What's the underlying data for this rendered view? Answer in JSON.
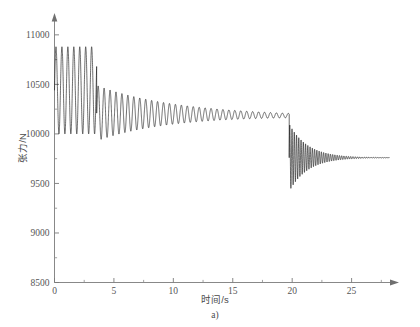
{
  "figure": {
    "caption": "a)",
    "background_color": "#ffffff",
    "trace_color": "#141414",
    "axis_color": "#7a7a7a"
  },
  "axes": {
    "y": {
      "title": "张力/N",
      "tick_labels": [
        "8500",
        "9000",
        "9500",
        "10000",
        "10500",
        "11000"
      ],
      "tick_values": [
        8500,
        9000,
        9500,
        10000,
        10500,
        11000
      ],
      "minor_tick_values": [
        8750,
        9250,
        9750,
        10250,
        10750
      ]
    },
    "x": {
      "title": "时间/s",
      "tick_labels": [
        "0",
        "5",
        "10",
        "15",
        "20",
        "25"
      ],
      "tick_values": [
        0,
        5,
        10,
        15,
        20,
        25
      ],
      "minor_tick_values": [
        2.5,
        7.5,
        12.5,
        17.5,
        22.5,
        27.5
      ]
    }
  },
  "chart_data": {
    "type": "line",
    "title": "",
    "subtitle": "",
    "caption": "a)",
    "xlabel": "时间/s",
    "ylabel": "张力/N",
    "xlim": [
      0,
      28.4
    ],
    "ylim": [
      8500,
      11150
    ],
    "grid": false,
    "legend": null,
    "x_ticks": [
      0,
      5,
      10,
      15,
      20,
      25
    ],
    "y_ticks": [
      8500,
      9000,
      9500,
      10000,
      10500,
      11000
    ],
    "series": [
      {
        "name": "张力",
        "description": "Oscillating tension signal with three phases: a high-amplitude startup oscillation, a slowly decaying steady oscillation, and a sudden large negative transient burst near 20 s that decays to a lower steady level.",
        "phases": [
          {
            "name": "startup-oscillation",
            "t_start": 0.0,
            "t_end": 3.55,
            "mean_start": 10440,
            "mean_end": 10440,
            "amplitude_start": 440,
            "amplitude_end": 440,
            "period": 0.5,
            "peak_high": 10880,
            "peak_low": 10000
          },
          {
            "name": "decaying-steady-oscillation",
            "t_start": 3.55,
            "t_end": 19.75,
            "mean_start": 10210,
            "mean_end": 10185,
            "amplitude_start": 280,
            "amplitude_end": 22,
            "period": 0.5,
            "peak_high": 10490,
            "peak_low": 9930
          },
          {
            "name": "transient-burst-decay",
            "t_start": 19.75,
            "t_end": 28.2,
            "mean_start": 9760,
            "mean_end": 9760,
            "amplitude_start": 340,
            "amplitude_end": 0,
            "period": 0.19,
            "peak_high": 10180,
            "peak_low": 9430,
            "decay_tau": 1.55
          }
        ],
        "key_values": {
          "initial_level": 10440,
          "startup_peak_max": 10880,
          "startup_peak_min": 10000,
          "steady_level": 10185,
          "burst_onset_time": 19.75,
          "burst_min": 9430,
          "final_level": 9760
        }
      }
    ]
  }
}
